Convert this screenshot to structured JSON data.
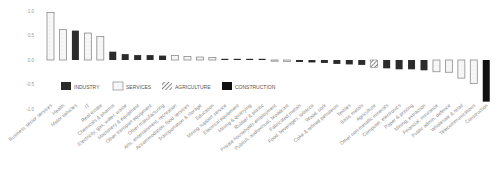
{
  "chart_data": {
    "type": "bar",
    "title": "",
    "xlabel": "",
    "ylabel": "",
    "ylim": [
      -1.0,
      1.0
    ],
    "yticks": [
      "1.0",
      "0.5",
      "0.0",
      "-0.5",
      "-1.0"
    ],
    "grid": false,
    "legend_position": "inside-lower-left",
    "legend": [
      {
        "name": "INDUSTRY",
        "style": "solid-dark"
      },
      {
        "name": "SERVICES",
        "style": "outline-light"
      },
      {
        "name": "AGRICULTURE",
        "style": "hatched"
      },
      {
        "name": "CONSTRUCTION",
        "style": "solid-black"
      }
    ],
    "categories": [
      "Business sector services",
      "Health",
      "Motor vehicles",
      "IT",
      "Real estate",
      "Chemicals & pharma",
      "Electricity, gas, water, waste",
      "Machinery & equipment",
      "Other transport equipment",
      "Other manufacturing",
      "Arts, entertainment, recreation",
      "Accommodation, food services",
      "Transportation & storage",
      "Education",
      "Mining support service",
      "Electrical equipment",
      "Mining & quarrying",
      "Rubber & plastic",
      "Private households employment",
      "Publish, audiovisual, broadcast",
      "Fabricated metals",
      "Food, beverages, tobacco",
      "Wood, cork",
      "Coke & refined petroleum",
      "Textiles",
      "Basic metals",
      "Agriculture",
      "Other non-metallic minerals",
      "Computer, electronics",
      "Paper & printing",
      "Mining, extraction",
      "Financial, insurance",
      "Public admin, defence",
      "Wholesale & retail",
      "Telecommunications",
      "Construction"
    ],
    "values": [
      0.97,
      0.62,
      0.6,
      0.55,
      0.48,
      0.17,
      0.12,
      0.1,
      0.1,
      0.09,
      0.09,
      0.07,
      0.06,
      0.05,
      0.0,
      0.0,
      0.0,
      0.0,
      -0.01,
      -0.03,
      -0.04,
      -0.05,
      -0.06,
      -0.08,
      -0.09,
      -0.1,
      -0.15,
      -0.17,
      -0.19,
      -0.19,
      -0.21,
      -0.24,
      -0.25,
      -0.37,
      -0.48,
      -0.85
    ],
    "sectors": [
      "SERVICES",
      "SERVICES",
      "INDUSTRY",
      "SERVICES",
      "SERVICES",
      "INDUSTRY",
      "INDUSTRY",
      "INDUSTRY",
      "INDUSTRY",
      "INDUSTRY",
      "SERVICES",
      "SERVICES",
      "SERVICES",
      "SERVICES",
      "INDUSTRY",
      "INDUSTRY",
      "INDUSTRY",
      "INDUSTRY",
      "SERVICES",
      "SERVICES",
      "INDUSTRY",
      "INDUSTRY",
      "INDUSTRY",
      "INDUSTRY",
      "INDUSTRY",
      "INDUSTRY",
      "AGRICULTURE",
      "INDUSTRY",
      "INDUSTRY",
      "INDUSTRY",
      "INDUSTRY",
      "SERVICES",
      "SERVICES",
      "SERVICES",
      "SERVICES",
      "CONSTRUCTION"
    ]
  },
  "colors": {
    "industry": "#2b2b2b",
    "services_fill": "#f4f4f4",
    "services_stroke": "#8c8c8c",
    "agriculture_stroke": "#6a6a6a",
    "construction": "#111111",
    "axis_text": "#9a9a9a",
    "label_text": "#8a8a8a"
  }
}
